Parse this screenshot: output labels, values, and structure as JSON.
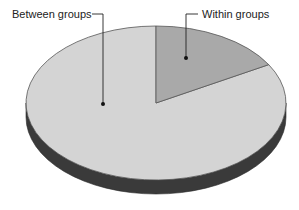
{
  "chart_data": {
    "type": "pie",
    "style": "3d",
    "title": "",
    "slices": [
      {
        "label": "Between groups",
        "value": 83.3,
        "color": "#d4d4d4"
      },
      {
        "label": "Within groups",
        "value": 16.7,
        "color": "#a9a9a9"
      }
    ],
    "units": "percent",
    "start_angle_deg": 90,
    "direction": "clockwise-from-top-for-within",
    "side_color": "#3a3a3a",
    "edge_color": "#555555",
    "label_color": "#222222",
    "legend": "none",
    "annotations": [
      "Between groups",
      "Within groups"
    ]
  }
}
